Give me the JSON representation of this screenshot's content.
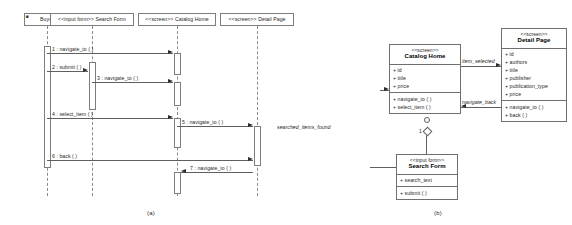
{
  "figure": {
    "caption_a": "(a)",
    "caption_b": "(b)"
  },
  "sequence_diagram": {
    "lifelines": [
      {
        "label": "Buyer",
        "stereotype": ""
      },
      {
        "label": "<<input form>> Search Form",
        "stereotype": "<<input form>>"
      },
      {
        "label": "<<screen>> Catalog Home",
        "stereotype": "<<screen>>"
      },
      {
        "label": "<<screen>> Detail Page",
        "stereotype": "<<screen>>"
      }
    ],
    "messages": [
      {
        "num": "1",
        "label": "1 : navigate_to ( )",
        "from": "Buyer",
        "to": "Catalog Home",
        "direction": "right"
      },
      {
        "num": "2",
        "label": "2 : submit ( )",
        "from": "Buyer",
        "to": "Search Form",
        "direction": "right"
      },
      {
        "num": "3",
        "label": "3 : navigate_to ( )",
        "from": "Search Form",
        "to": "Catalog Home",
        "direction": "right"
      },
      {
        "num": "4",
        "label": "4 : select_item ( )",
        "from": "Buyer",
        "to": "Catalog Home",
        "direction": "right"
      },
      {
        "num": "5",
        "label": "5 : navigate_to ( )",
        "from": "Catalog Home",
        "to": "Detail Page",
        "direction": "right"
      },
      {
        "num": "6",
        "label": "6 : back ( )",
        "from": "Buyer",
        "to": "Detail Page",
        "direction": "right"
      },
      {
        "num": "7",
        "label": "7 : navigate_to ( )",
        "from": "Detail Page",
        "to": "Catalog Home",
        "direction": "left"
      }
    ]
  },
  "class_diagram": {
    "classes": [
      {
        "id": "catalog_home",
        "stereotype": "<<screen>>",
        "name": "Catalog Home",
        "attributes": [
          "+ id",
          "+ title",
          "+ price"
        ],
        "operations": [
          "+ navigate_to ( )",
          "+ select_item ( )"
        ]
      },
      {
        "id": "detail_page",
        "stereotype": "<<screen>>",
        "name": "Detail Page",
        "attributes": [
          "+ id",
          "+ authors",
          "+ title",
          "+ publisher",
          "+ publication_type",
          "+ price"
        ],
        "operations": [
          "+ navigate_to ( )",
          "+ back ( )"
        ]
      },
      {
        "id": "search_form",
        "stereotype": "<<input form>>",
        "name": "Search Form",
        "attributes": [
          "+ search_text"
        ],
        "operations": [
          "+ submit ( )"
        ]
      }
    ],
    "associations": [
      {
        "label": "item_selected",
        "from": "catalog_home",
        "to": "detail_page"
      },
      {
        "label": "navigate_back",
        "from": "detail_page",
        "to": "catalog_home"
      },
      {
        "label": "searched_items_found",
        "from": "search_form",
        "to": "catalog_home"
      }
    ],
    "multiplicities": [
      {
        "value": "1",
        "near": "search_form"
      }
    ]
  }
}
